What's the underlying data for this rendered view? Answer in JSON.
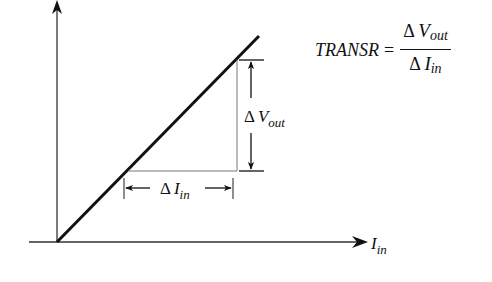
{
  "diagram": {
    "type": "transresistance transfer characteristic",
    "x_axis": {
      "label_main": "I",
      "label_sub": "in"
    },
    "y_axis": {
      "label_main": "",
      "label_sub": ""
    },
    "delta_vout": {
      "symbol": "Δ",
      "main": "V",
      "sub": "out"
    },
    "delta_iin": {
      "symbol": "Δ",
      "main": "I",
      "sub": "in"
    },
    "formula": {
      "name": "TRANSR",
      "equals": "=",
      "numerator": {
        "symbol": "Δ",
        "main": "V",
        "sub": "out"
      },
      "denominator": {
        "symbol": "Δ",
        "main": "I",
        "sub": "in"
      }
    },
    "colors": {
      "line": "#111111",
      "thin": "#555555",
      "background": "#ffffff"
    }
  }
}
